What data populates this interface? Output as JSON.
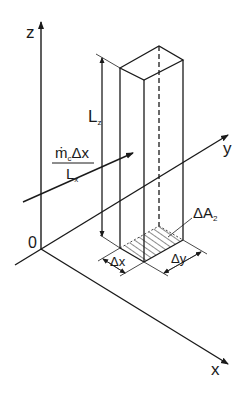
{
  "figure": {
    "type": "isometric-control-volume-diagram",
    "colors": {
      "line": "#1a1a1a",
      "background": "#ffffff"
    },
    "axes": {
      "z": {
        "label": "z"
      },
      "y": {
        "label": "y"
      },
      "x": {
        "label": "x"
      },
      "origin": {
        "label": "0"
      }
    },
    "labels": {
      "height": {
        "main": "L",
        "sub": "z"
      },
      "flux_numerator": {
        "main": "ṁ",
        "sub": "c",
        "tail": "Δx"
      },
      "flux_denominator": {
        "main": "L",
        "sub": "x"
      },
      "area": {
        "main": "ΔA",
        "sub": "2"
      },
      "dx": "Δx",
      "dy": "Δy"
    }
  }
}
